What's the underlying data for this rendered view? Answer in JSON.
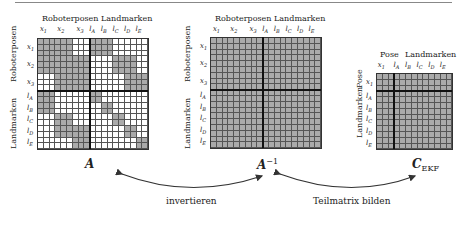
{
  "matrices": {
    "A": {
      "name": "A",
      "col_group_header": "Roboterposen  Landmarken",
      "row_group_labels": [
        "Roboterposen",
        "Landmarken"
      ],
      "col_labels": [
        "x1",
        "x2",
        "x3",
        "lA",
        "lB",
        "lC",
        "lD",
        "lE"
      ],
      "row_labels": [
        "x1",
        "x2",
        "x3",
        "lA",
        "lB",
        "lC",
        "lD",
        "lE"
      ],
      "size": 19,
      "pattern_desc": "sparse: 3 pose blocks (3x3 each) then 5 landmark blocks (2x2 each); gray = nonzero",
      "rows": [
        "1111110001111000000",
        "1111110001111000000",
        "1111110001111000000",
        "1111111110000111100",
        "1111111110000111100",
        "1111111110000111100",
        "0001111110000001111",
        "0001111110000001111",
        "0001111110000001111",
        "1110000001100000000",
        "1110000001100000000",
        "1110000000011000000",
        "1110000000011000000",
        "0001110000000110000",
        "0001110000000110000",
        "0001111110000001100",
        "0001111110000001100",
        "0000001110000000011",
        "0000001110000000011"
      ]
    },
    "A_inv": {
      "name": "A",
      "superscript": "−1",
      "col_group_header": "Roboterposen  Landmarken",
      "row_group_labels": [
        "Roboterposen",
        "Landmarken"
      ],
      "col_labels": [
        "x1",
        "x2",
        "x3",
        "lA",
        "lB",
        "lC",
        "lD",
        "lE"
      ],
      "row_labels": [
        "x1",
        "x2",
        "x3",
        "lA",
        "lB",
        "lC",
        "lD",
        "lE"
      ],
      "size": 19,
      "pattern_desc": "dense: all cells gray"
    },
    "C_EKF": {
      "name": "C",
      "subscript": "EKF",
      "col_group_header_left": "Pose",
      "col_group_header_right": "Landmarken",
      "row_group_labels": [
        "Pose",
        "Landmarken"
      ],
      "col_labels": [
        "x1",
        "lA",
        "lB",
        "lC",
        "lD",
        "lE"
      ],
      "row_labels": [
        "x1",
        "lA",
        "lB",
        "lC",
        "lD",
        "lE"
      ],
      "size": 13,
      "pattern_desc": "dense: all cells gray"
    }
  },
  "arrows": [
    {
      "from": "A_inv",
      "to": "A",
      "label": "invertieren",
      "bidirectional": true
    },
    {
      "from": "C_EKF",
      "to": "A_inv",
      "label": "Teilmatrix bilden",
      "bidirectional": true
    }
  ],
  "colors": {
    "filled": "#aaaaaa",
    "empty": "#ffffff",
    "grid": "#555555",
    "separator": "#111111",
    "arrow": "#333333"
  }
}
